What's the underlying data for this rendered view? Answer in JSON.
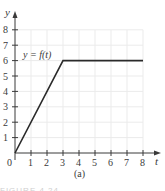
{
  "chart_data": {
    "type": "line",
    "title": "",
    "xlabel": "t",
    "ylabel": "y",
    "function_label": "y = f(t)",
    "caption": "(a)",
    "figure_caption": "FIGURE 4.24",
    "x_ticks": [
      "0",
      "1",
      "2",
      "3",
      "4",
      "5",
      "6",
      "7",
      "8"
    ],
    "y_ticks": [
      "1",
      "2",
      "3",
      "4",
      "5",
      "6",
      "7",
      "8"
    ],
    "xlim": [
      0,
      8
    ],
    "ylim": [
      0,
      8
    ],
    "grid": true,
    "series": [
      {
        "name": "f(t)",
        "points": [
          [
            0,
            0
          ],
          [
            3,
            6
          ],
          [
            8,
            6
          ]
        ]
      }
    ],
    "colors": {
      "line": "#2a2a2a",
      "axis": "#3a3a3a",
      "grid": "#ebebeb"
    }
  }
}
